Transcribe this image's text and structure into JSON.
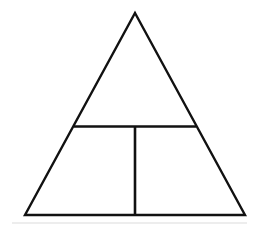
{
  "figure": {
    "title": "Triangle divided by a horizontal chord and a vertical segment",
    "canvas": {
      "width": 259,
      "height": 226,
      "background_color": "#ffffff"
    },
    "style": {
      "stroke_color": "#111111",
      "stroke_width": 2.4,
      "fill": "none",
      "line_cap": "butt",
      "line_join": "miter",
      "artifact_color": "#cfcfcf"
    },
    "labels": {
      "apex": "",
      "bottom_left": "",
      "bottom_right": "",
      "chord_left": "",
      "chord_right": "",
      "foot": ""
    },
    "shapes": [
      {
        "name": "outer-triangle",
        "type": "polygon",
        "points": "135,13 245,215 25,215",
        "stroke": "#111111",
        "stroke_width": 2.4,
        "fill": "none"
      },
      {
        "name": "horizontal-divider",
        "type": "line",
        "x1": 74,
        "y1": 126.5,
        "x2": 196,
        "y2": 126.5,
        "stroke": "#111111",
        "stroke_width": 2.6
      },
      {
        "name": "vertical-divider",
        "type": "line",
        "x1": 135,
        "y1": 126.5,
        "x2": 135,
        "y2": 215,
        "stroke": "#111111",
        "stroke_width": 2.6
      },
      {
        "name": "scan-artifact-baseline",
        "type": "line",
        "x1": 12,
        "y1": 223,
        "x2": 247,
        "y2": 223,
        "stroke": "#dcdcdc",
        "stroke_width": 1.2
      }
    ],
    "vertices": {
      "apex": {
        "x": 135,
        "y": 13
      },
      "bottom_left": {
        "x": 25,
        "y": 215
      },
      "bottom_right": {
        "x": 245,
        "y": 215
      },
      "chord_left": {
        "x": 74,
        "y": 126.5
      },
      "chord_right": {
        "x": 196,
        "y": 126.5
      },
      "chord_midpoint": {
        "x": 135,
        "y": 126.5
      },
      "base_midpoint": {
        "x": 135,
        "y": 215
      }
    },
    "regions": [
      {
        "name": "upper-triangle",
        "points": "135,13 196,126.5 74,126.5"
      },
      {
        "name": "lower-left-quadrilateral",
        "points": "74,126.5 135,126.5 135,215 25,215"
      },
      {
        "name": "lower-right-quadrilateral",
        "points": "135,126.5 196,126.5 245,215 135,215"
      }
    ]
  }
}
